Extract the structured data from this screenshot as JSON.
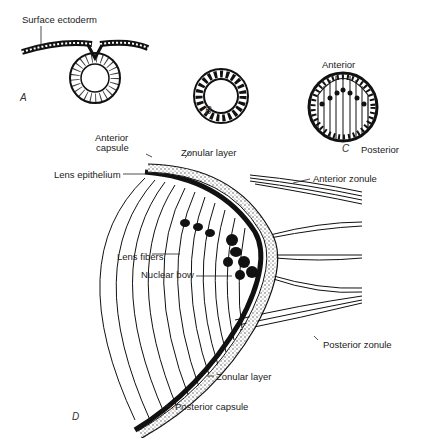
{
  "figure": {
    "panels": [
      {
        "id": "A",
        "label": "A",
        "description": "Lens pit invaginating from surface ectoderm"
      },
      {
        "id": "B",
        "label": "B",
        "description": "Lens vesicle"
      },
      {
        "id": "C",
        "label": "C",
        "description": "Primary lens fibers elongating"
      },
      {
        "id": "D",
        "label": "D",
        "description": "Mature lens equator cross-section"
      }
    ],
    "labels": {
      "surface_ectoderm": "Surface ectoderm",
      "anterior": "Anterior",
      "posterior": "Posterior",
      "anterior_capsule_1": "Anterior",
      "anterior_capsule_2": "capsule",
      "zonular_layer_top": "Zonular layer",
      "lens_epithelium": "Lens epithelium",
      "anterior_zonule": "Anterior zonule",
      "lens_fibers": "Lens fibers",
      "nuclear_bow": "Nuclear bow",
      "posterior_zonule": "Posterior zonule",
      "zonular_layer_bottom": "Zonular layer",
      "posterior_capsule": "Posterior capsule"
    }
  }
}
